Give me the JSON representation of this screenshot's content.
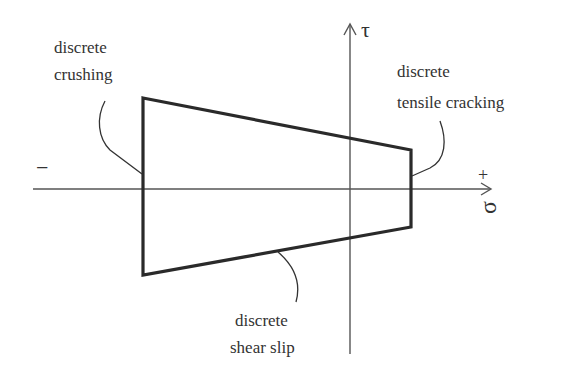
{
  "diagram": {
    "axes": {
      "vertical_label": "τ",
      "horizontal_label": "σ",
      "negative_sign": "−",
      "positive_sign": "+"
    },
    "labels": {
      "crushing": [
        "discrete",
        "crushing"
      ],
      "tensile": [
        "discrete",
        "tensile cracking"
      ],
      "shear": [
        "discrete",
        "shear slip"
      ]
    },
    "colors": {
      "line": "#2a2a2a",
      "axis": "#555555",
      "text": "#333333"
    }
  }
}
